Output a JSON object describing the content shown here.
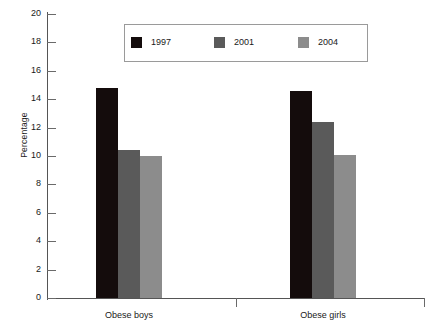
{
  "chart_data": {
    "type": "bar",
    "title": "",
    "xlabel": "",
    "ylabel": "Percentage",
    "ylim": [
      0,
      20
    ],
    "ytick_step": 2,
    "yticks": [
      0,
      2,
      4,
      6,
      8,
      10,
      12,
      14,
      16,
      18,
      20
    ],
    "categories": [
      "Obese boys",
      "Obese girls"
    ],
    "series": [
      {
        "name": "1997",
        "color": "#140c0c",
        "values": [
          14.8,
          14.6
        ]
      },
      {
        "name": "2001",
        "color": "#5a5a5a",
        "values": [
          10.4,
          12.4
        ]
      },
      {
        "name": "2004",
        "color": "#8c8c8c",
        "values": [
          10.0,
          10.1
        ]
      }
    ],
    "grid": false,
    "legend_position": "top-center",
    "legend_entries": [
      "1997",
      "2001",
      "2004"
    ]
  },
  "axes": {
    "y_title": "Percentage",
    "y_tick_labels": [
      "20",
      "18",
      "16",
      "14",
      "12",
      "10",
      "8",
      "6",
      "4",
      "2",
      "0"
    ],
    "x_tick_labels": [
      "Obese boys",
      "Obese girls"
    ]
  },
  "colors": {
    "series_1997": "#140c0c",
    "series_2001": "#5a5a5a",
    "series_2004": "#8c8c8c",
    "axis": "#555555",
    "legend_border": "#9a9a9a",
    "background": "#ffffff"
  }
}
